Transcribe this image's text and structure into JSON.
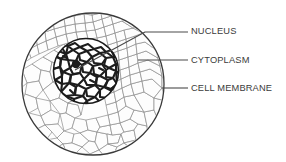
{
  "diagram": {
    "background_color": "#ffffff",
    "labels": [
      {
        "id": "nucleus",
        "text": "NUCLEUS",
        "text_x": 191,
        "text_y": 31,
        "leader": {
          "type": "elbow",
          "points": "75,70 145,32 188,32"
        }
      },
      {
        "id": "cytoplasm",
        "text": "CYTOPLASM",
        "text_x": 191,
        "text_y": 60,
        "leader": {
          "type": "straight",
          "points": "138,60 188,60"
        }
      },
      {
        "id": "cell-membrane",
        "text": "CELL MEMBRANE",
        "text_x": 191,
        "text_y": 88,
        "leader": {
          "type": "straight",
          "points": "162,88 188,88"
        }
      }
    ],
    "structures": {
      "cell_membrane": {
        "name": "cell membrane",
        "shape": "circle",
        "cx": 93,
        "cy": 84,
        "r": 71,
        "stroke_color": "#3a3a3a",
        "fill_color": "#ffffff"
      },
      "cytoplasm": {
        "name": "cytoplasm",
        "shape": "circle",
        "cx": 93,
        "cy": 84,
        "r": 70,
        "texture": "irregular-polygon-cobblestone",
        "stroke_color": "#8a8a8a",
        "fill_color": "#fcfcfc"
      },
      "nucleus": {
        "name": "nucleus",
        "shape": "circle",
        "cx": 86,
        "cy": 71,
        "r": 33,
        "texture": "dense-chromatin-network",
        "stroke_color": "#1a1a1a",
        "fill_color": "#ffffff"
      }
    },
    "colors": {
      "outline": "#3a3a3a",
      "cytoplasm_stroke": "#8a8a8a",
      "nucleus_stroke": "#1a1a1a",
      "leader_line": "#4a4a4a",
      "label_text": "#3b3b3b"
    }
  }
}
